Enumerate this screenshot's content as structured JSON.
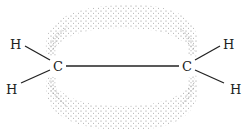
{
  "diagram": {
    "atoms": {
      "c_left": "C",
      "c_right": "C",
      "h_top_left": "H",
      "h_bottom_left": "H",
      "h_top_right": "H",
      "h_bottom_right": "H"
    },
    "colors": {
      "stipple": "#8a8a8a",
      "bond": "#222222",
      "text": "#222222"
    }
  }
}
